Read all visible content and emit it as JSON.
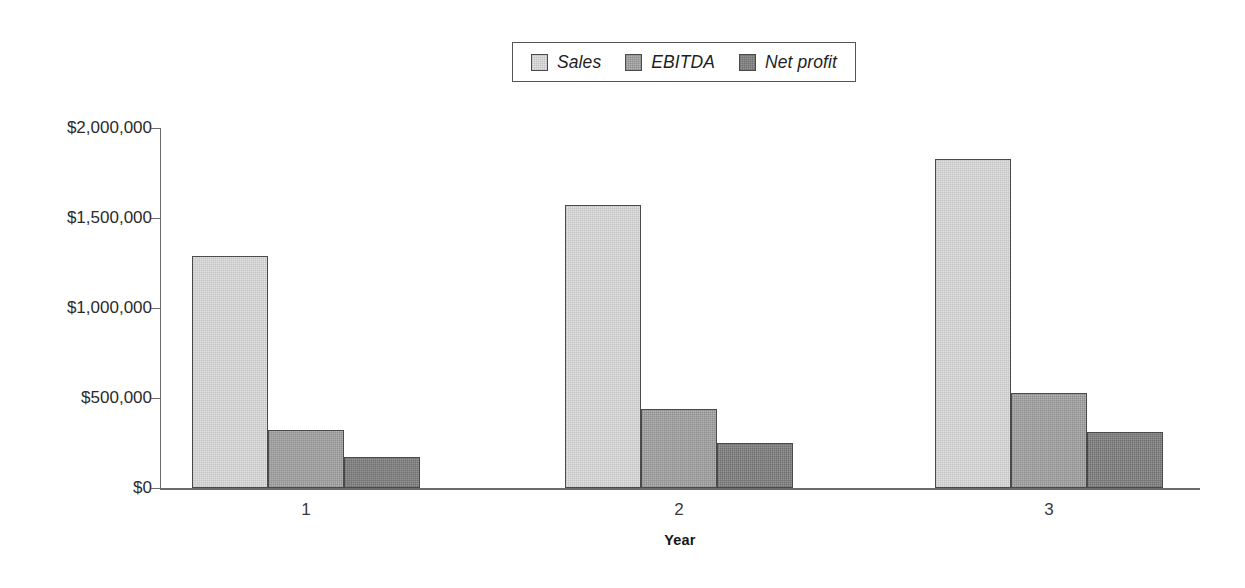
{
  "chart_data": {
    "type": "bar",
    "title": "",
    "xlabel": "Year",
    "ylabel": "",
    "categories": [
      "1",
      "2",
      "3"
    ],
    "series": [
      {
        "name": "Sales",
        "values": [
          1290000,
          1570000,
          1830000
        ],
        "color": "#e2e2e2"
      },
      {
        "name": "EBITDA",
        "values": [
          320000,
          440000,
          530000
        ],
        "color": "#b3b3b3"
      },
      {
        "name": "Net profit",
        "values": [
          170000,
          250000,
          310000
        ],
        "color": "#969696"
      }
    ],
    "ylim": [
      0,
      2000000
    ],
    "ytick_values": [
      0,
      500000,
      1000000,
      1500000,
      2000000
    ],
    "ytick_labels": [
      "$0",
      "$500,000",
      "$1,000,000",
      "$1,500,000",
      "$2,000,000"
    ],
    "grid": false,
    "legend_position": "top-center",
    "legend_entries": [
      "Sales",
      "EBITDA",
      "Net profit"
    ]
  },
  "axes": {
    "x_title": "Year",
    "x_tick_labels": [
      "1",
      "2",
      "3"
    ],
    "y_tick_labels": [
      "$2,000,000",
      "$1,500,000",
      "$1,000,000",
      "$500,000",
      "$0"
    ]
  },
  "legend": {
    "items": [
      {
        "label": "Sales",
        "swatch": "sales-swatch"
      },
      {
        "label": "EBITDA",
        "swatch": "ebitda-swatch"
      },
      {
        "label": "Net profit",
        "swatch": "netprofit-swatch"
      }
    ]
  }
}
